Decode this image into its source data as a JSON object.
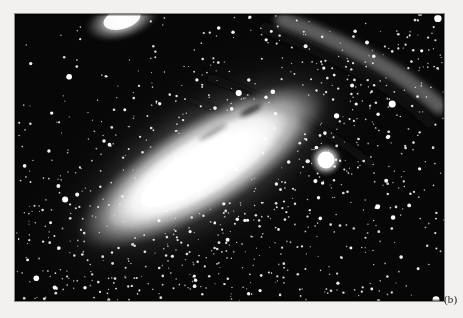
{
  "figure": {
    "label": "(b)",
    "medium": "black-and-white astronomical photograph",
    "background_color": "#f2f1ef",
    "plate": {
      "x": 15,
      "y": 14,
      "width": 429,
      "height": 287,
      "sky_color": "#060606",
      "border_color": "#8d8a86"
    },
    "objects": [
      {
        "name": "m31-core",
        "description": "bright elongated nuclear bulge and inner disk of the spiral galaxy",
        "cx": 200,
        "cy": 165,
        "length": 292,
        "width": 96,
        "angle_deg": -31,
        "peak_color": "#ffffff"
      },
      {
        "name": "m31-outer-disk",
        "description": "diffuse outer disk halo surrounding the bright core",
        "cx": 205,
        "cy": 162,
        "length": 430,
        "width": 210,
        "angle_deg": -31,
        "color": "#9a9a9a"
      },
      {
        "name": "dust-lane-upper",
        "description": "dark dust lane cutting along the upper-right flank of the disk",
        "angle_deg": -31,
        "color": "#161616"
      },
      {
        "name": "dust-lane-outer",
        "description": "second fainter dust lane farther out on the upper-right arm",
        "angle_deg": -31,
        "color": "#1d1d1d"
      },
      {
        "name": "m32-companion",
        "description": "bright compact elliptical companion galaxy",
        "cx": 310,
        "cy": 146,
        "radius": 12,
        "color": "#ffffff"
      },
      {
        "name": "m110-companion",
        "description": "diffuse elliptical companion clipped by the top edge of the plate",
        "cx": 105,
        "cy": 8,
        "rx": 34,
        "ry": 17,
        "angle_deg": -18,
        "color": "#e8e8e8"
      }
    ],
    "star_field": {
      "description": "dense field of white foreground and resolved stars across the plate",
      "count": 900,
      "color": "#ffffff"
    }
  }
}
